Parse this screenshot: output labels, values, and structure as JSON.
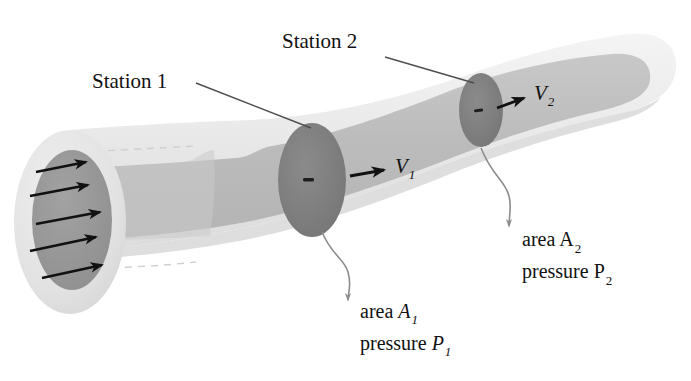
{
  "figure": {
    "type": "engineering-diagram"
  },
  "colors": {
    "background": "#ffffff",
    "pipe_outer_wall": "#e9e9e9",
    "pipe_outer_wall_shadow": "#dedede",
    "pipe_inner_flow": "#bdbdbd",
    "pipe_inner_flow_light": "#cfcfcf",
    "station_disc": "#7d7d7d",
    "station_disc_2": "#8a8a8a",
    "inlet_disc": "#999999",
    "arrow": "#111111",
    "leader_line": "#5a5a5a",
    "leader_curl": "#8c8c8c",
    "text": "#111111"
  },
  "labels": {
    "station1": {
      "text": "Station 1",
      "x": 92,
      "y": 88
    },
    "station2": {
      "text": "Station 2",
      "x": 282,
      "y": 48
    },
    "velocity1": {
      "symbol": "V",
      "subscript": "1",
      "x": 395,
      "y": 173
    },
    "velocity2": {
      "symbol": "V",
      "subscript": "2",
      "x": 534,
      "y": 100
    },
    "station1_callout": {
      "line1_prefix": "area ",
      "line1_symbol": "A",
      "line1_subscript": "1",
      "line1_italic": true,
      "line2_prefix": "pressure ",
      "line2_symbol": "P",
      "line2_subscript": "1",
      "line2_italic": true,
      "x": 360,
      "y_line1": 318,
      "y_line2": 350
    },
    "station2_callout": {
      "line1_prefix": "area ",
      "line1_symbol": "A",
      "line1_subscript": "2",
      "line1_italic": false,
      "line2_prefix": "pressure ",
      "line2_symbol": "P",
      "line2_subscript": "2",
      "line2_italic": false,
      "x": 522,
      "y_line1": 246,
      "y_line2": 278
    }
  },
  "geometry": {
    "inlet_center": {
      "cx": 70,
      "cy": 222
    },
    "inlet_outer_rx": 56,
    "inlet_outer_ry": 92,
    "inlet_inner_rx": 40,
    "inlet_inner_ry": 70,
    "station1_disc": {
      "cx": 312,
      "cy": 180,
      "rx": 34,
      "ry": 56
    },
    "station2_disc": {
      "cx": 481,
      "cy": 110,
      "rx": 22,
      "ry": 36
    },
    "outlet_end": {
      "x": 660,
      "y": 78
    }
  },
  "flow_arrows": {
    "count": 5,
    "description": "velocity-profile-arrows",
    "arrows": [
      {
        "x1": 32,
        "y1": 170,
        "x2": 86,
        "y2": 160
      },
      {
        "x1": 27,
        "y1": 193,
        "x2": 88,
        "y2": 183
      },
      {
        "x1": 33,
        "y1": 222,
        "x2": 101,
        "y2": 211
      },
      {
        "x1": 26,
        "y1": 248,
        "x2": 95,
        "y2": 235
      },
      {
        "x1": 38,
        "y1": 276,
        "x2": 102,
        "y2": 263
      }
    ]
  },
  "icons": {
    "velocity_arrow_1": "right-arrow-icon",
    "velocity_arrow_2": "right-arrow-icon",
    "callout_arrow_1": "down-arrow-icon",
    "callout_arrow_2": "down-arrow-icon"
  }
}
